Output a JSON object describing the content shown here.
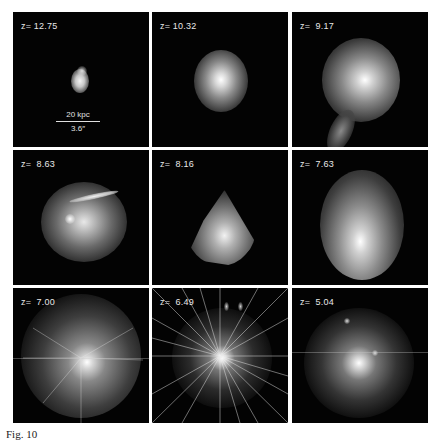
{
  "figure": {
    "panels": [
      {
        "redshift_label": "z= 12.75",
        "z": 12.75
      },
      {
        "redshift_label": "z= 10.32",
        "z": 10.32
      },
      {
        "redshift_label": "z=  9.17",
        "z": 9.17
      },
      {
        "redshift_label": "z=  8.63",
        "z": 8.63
      },
      {
        "redshift_label": "z=  8.16",
        "z": 8.16
      },
      {
        "redshift_label": "z=  7.63",
        "z": 7.63
      },
      {
        "redshift_label": "z=  7.00",
        "z": 7.0
      },
      {
        "redshift_label": "z=  6.49",
        "z": 6.49
      },
      {
        "redshift_label": "z=  5.04",
        "z": 5.04
      }
    ],
    "scale_bar": {
      "physical": "20 kpc",
      "angular": "3.6″"
    },
    "caption_partial": "Fig. 10"
  }
}
